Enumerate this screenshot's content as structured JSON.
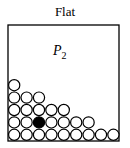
{
  "title": "Flat",
  "label": {
    "base": "P",
    "subscript": "2"
  },
  "colors": {
    "stroke": "#000000",
    "fill_empty": "#ffffff",
    "fill_marked": "#000000"
  },
  "box": {
    "x": 8,
    "y": 25,
    "width": 111,
    "height": 116
  },
  "circle": {
    "diameter": 12.4
  },
  "rows": [
    {
      "count": 9,
      "marked_index": null
    },
    {
      "count": 7,
      "marked_index": 2
    },
    {
      "count": 5,
      "marked_index": null
    },
    {
      "count": 3,
      "marked_index": null
    },
    {
      "count": 1,
      "marked_index": null
    }
  ]
}
